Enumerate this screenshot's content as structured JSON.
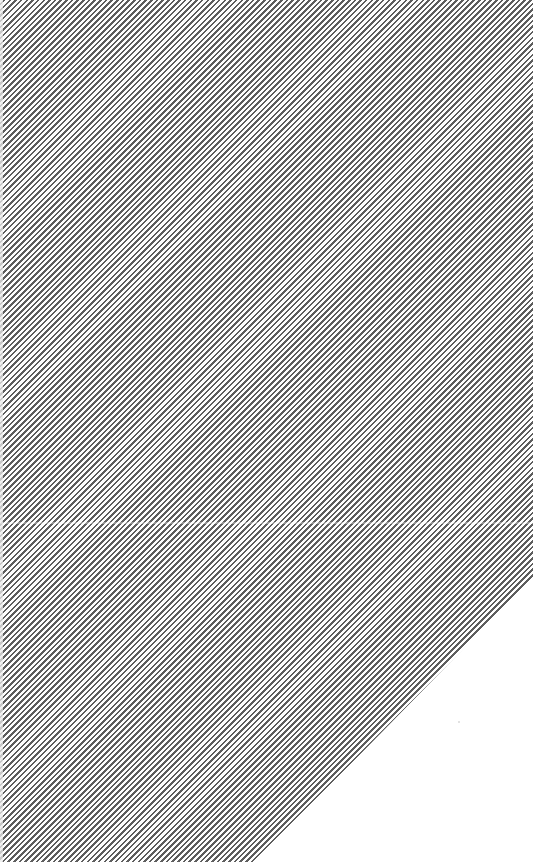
{
  "pattern": {
    "type": "diagonal-hatch",
    "direction": "bottom-left to top-right",
    "line_color": "#5e5e5e",
    "background_color": "#ffffff",
    "line_spacing_px": 6
  },
  "regions": {
    "hatched_area": "polygon (0,0) (533,0) (533,578) (255,862) (0,862)",
    "blank_area": "triangle (533,578) (533,862) (255,862)"
  }
}
